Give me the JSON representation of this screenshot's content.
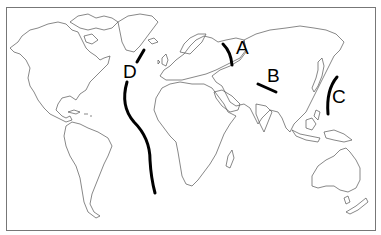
{
  "map": {
    "type": "world-outline",
    "frame_color": "#777777",
    "coast_color": "#555555",
    "belt_color": "#000000",
    "labels": [
      {
        "id": "A",
        "text": "A",
        "x": 236,
        "y": 54
      },
      {
        "id": "B",
        "text": "B",
        "x": 267,
        "y": 82
      },
      {
        "id": "C",
        "text": "C",
        "x": 332,
        "y": 103
      },
      {
        "id": "D",
        "text": "D",
        "x": 123,
        "y": 78
      }
    ],
    "lines": [
      {
        "id": "A",
        "description": "short curved line in western Russia (Ural region)"
      },
      {
        "id": "B",
        "description": "short diagonal line in central Asia"
      },
      {
        "id": "C",
        "description": "curved line along East Asian coast / Japan"
      },
      {
        "id": "D",
        "description": "long curved line through the Atlantic Ocean (Mid-Atlantic Ridge)"
      }
    ]
  }
}
